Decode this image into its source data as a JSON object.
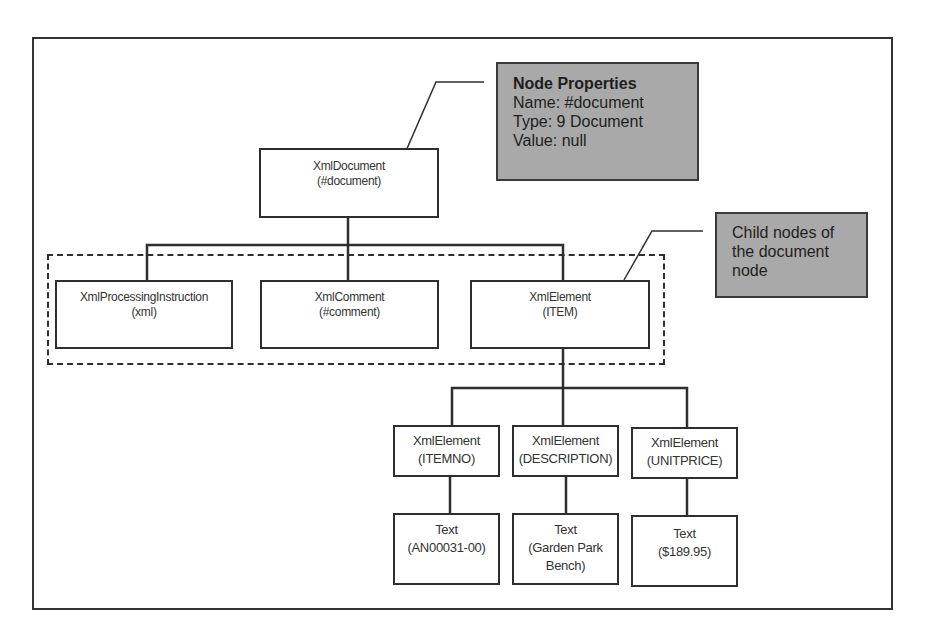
{
  "diagram": {
    "root": {
      "type": "XmlDocument",
      "name": "(#document)"
    },
    "properties_callout": {
      "title": "Node Properties",
      "lines": [
        "Name: #document",
        "Type: 9 Document",
        "Value: null"
      ]
    },
    "children_callout": {
      "lines": [
        "Child nodes of",
        "the document",
        "node"
      ]
    },
    "level1": [
      {
        "type": "XmlProcessingInstruction",
        "name": "(xml)"
      },
      {
        "type": "XmlComment",
        "name": "(#comment)"
      },
      {
        "type": "XmlElement",
        "name": "(ITEM)"
      }
    ],
    "level2": [
      {
        "type": "XmlElement",
        "name": "(ITEMNO)"
      },
      {
        "type": "XmlElement",
        "name": "(DESCRIPTION)"
      },
      {
        "type": "XmlElement",
        "name": "(UNITPRICE)"
      }
    ],
    "level3": [
      {
        "type": "Text",
        "lines": [
          "(AN00031-00)"
        ]
      },
      {
        "type": "Text",
        "lines": [
          "(Garden Park",
          "Bench)"
        ]
      },
      {
        "type": "Text",
        "lines": [
          "($189.95)"
        ]
      }
    ],
    "colors": {
      "line": "#2e2e2e",
      "callout_fill": "#a9a9a9",
      "background": "#ffffff"
    }
  }
}
